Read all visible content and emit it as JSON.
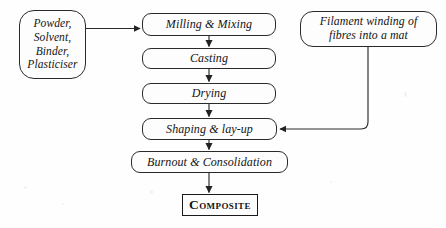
{
  "diagram": {
    "background_color": "#fefefe",
    "line_color": "#2a2a2a",
    "text_color": "#141414",
    "nodes": {
      "feedstock": {
        "label": "Powder,\nSolvent,\nBinder,\nPlasticiser",
        "shape": "rounded-rectangle"
      },
      "milling": {
        "label": "Milling & Mixing",
        "shape": "rounded-rectangle"
      },
      "casting": {
        "label": "Casting",
        "shape": "rounded-rectangle"
      },
      "drying": {
        "label": "Drying",
        "shape": "rounded-rectangle"
      },
      "shaping": {
        "label": "Shaping & lay-up",
        "shape": "rounded-rectangle"
      },
      "burnout": {
        "label": "Burnout & Consolidation",
        "shape": "rounded-rectangle"
      },
      "filament": {
        "label": "Filament winding of\nfibres into a mat",
        "shape": "rounded-rectangle"
      },
      "composite": {
        "label": "Composite",
        "shape": "rectangle"
      }
    },
    "edges": [
      {
        "name": "feedstock-to-milling",
        "from": "feedstock",
        "to": "milling",
        "style": "horizontal-arrow"
      },
      {
        "name": "milling-to-casting",
        "from": "milling",
        "to": "casting",
        "style": "vertical-arrow"
      },
      {
        "name": "casting-to-drying",
        "from": "casting",
        "to": "drying",
        "style": "vertical-arrow"
      },
      {
        "name": "drying-to-shaping",
        "from": "drying",
        "to": "shaping",
        "style": "vertical-arrow"
      },
      {
        "name": "shaping-to-burnout",
        "from": "shaping",
        "to": "burnout",
        "style": "vertical-arrow"
      },
      {
        "name": "burnout-to-composite",
        "from": "burnout",
        "to": "composite",
        "style": "vertical-arrow"
      },
      {
        "name": "filament-to-shaping",
        "from": "filament",
        "to": "shaping",
        "style": "elbow-arrow"
      }
    ]
  }
}
